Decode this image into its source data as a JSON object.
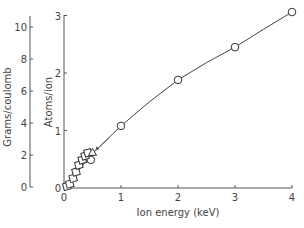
{
  "chart_data": {
    "type": "scatter",
    "title": "",
    "xlabel": "Ion energy (keV)",
    "ylabel_left": "Grams/coulomb",
    "ylabel_right": "Atoms/ion",
    "xlim": [
      0,
      4
    ],
    "ylim_atoms": [
      0,
      3
    ],
    "ylim_grams": [
      0,
      10
    ],
    "x_ticks": [
      "0",
      "1",
      "2",
      "3",
      "4"
    ],
    "y_ticks_atoms": [
      "0",
      "1",
      "2",
      "3"
    ],
    "y_ticks_grams": [
      "0",
      "2",
      "4",
      "6",
      "8",
      "10"
    ],
    "grid": false,
    "legend": null,
    "series": [
      {
        "name": "circles",
        "marker": "circle",
        "x": [
          0.47,
          1.0,
          2.0,
          3.0,
          4.0
        ],
        "y": [
          0.49,
          1.08,
          1.88,
          2.45,
          3.06
        ]
      },
      {
        "name": "squares",
        "marker": "square",
        "x": [
          0.05,
          0.1,
          0.16,
          0.21,
          0.26,
          0.32,
          0.37,
          0.42
        ],
        "y": [
          0.03,
          0.07,
          0.17,
          0.28,
          0.4,
          0.49,
          0.56,
          0.61
        ]
      },
      {
        "name": "triangle",
        "marker": "triangle",
        "x": [
          0.5
        ],
        "y": [
          0.62
        ]
      }
    ],
    "fit_curve": {
      "x": [
        0.0,
        0.5,
        1.0,
        1.5,
        2.0,
        2.5,
        3.0,
        3.5,
        4.0
      ],
      "y": [
        0.0,
        0.6,
        1.08,
        1.5,
        1.88,
        2.18,
        2.45,
        2.76,
        3.06
      ]
    },
    "annotations": [
      {
        "type": "arrow",
        "points_to": "triangle",
        "from": [
          0.9,
          1.05
        ]
      }
    ]
  },
  "labels": {
    "xlabel": "Ion energy (keV)",
    "ylabel_left": "Grams/coulomb",
    "ylabel_right": "Atoms/ion"
  }
}
